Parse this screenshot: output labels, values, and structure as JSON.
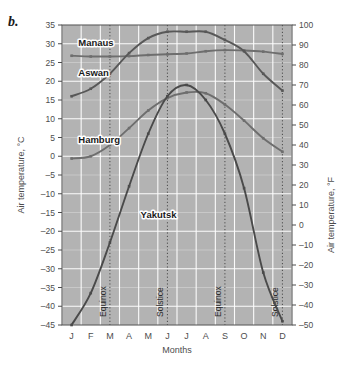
{
  "figure": {
    "panel_label": "b.",
    "background": "#ffffff",
    "plot_background": "#b3b3b3",
    "gridline_color": "#ffffff",
    "axis_color": "#4d4d4d",
    "marker_line_color": "#4d4d4d",
    "tick_label_color": "#4d4d4d"
  },
  "chart_data": {
    "type": "line",
    "title": "",
    "xlabel": "Months",
    "ylabel": "Air temperature, °C",
    "ylabel_right": "Air temperature, °F",
    "categories": [
      "J",
      "F",
      "M",
      "A",
      "M",
      "J",
      "J",
      "A",
      "S",
      "O",
      "N",
      "D"
    ],
    "month_names": [
      "January",
      "February",
      "March",
      "April",
      "May",
      "June",
      "July",
      "August",
      "September",
      "October",
      "November",
      "December"
    ],
    "ylim": [
      -45,
      35
    ],
    "yticks": [
      35,
      30,
      25,
      20,
      15,
      10,
      5,
      0,
      -5,
      -10,
      -15,
      -20,
      -25,
      -30,
      -35,
      -40,
      -45
    ],
    "ylim_right": [
      -50,
      100
    ],
    "yticks_right": [
      100,
      90,
      80,
      70,
      60,
      50,
      40,
      30,
      20,
      10,
      0,
      -10,
      -20,
      -30,
      -40,
      -50
    ],
    "grid": true,
    "legend_position": "inline-labels",
    "series": [
      {
        "name": "Manaus",
        "color": "#6e6e6e",
        "label_x_index": 0.35,
        "label_value": 29.5,
        "values": [
          26.8,
          26.6,
          26.6,
          26.7,
          27.0,
          27.2,
          27.4,
          28.0,
          28.3,
          28.2,
          27.9,
          27.3
        ]
      },
      {
        "name": "Aswan",
        "color": "#585858",
        "label_x_index": 0.35,
        "label_value": 21.5,
        "values": [
          16.0,
          18.0,
          22.0,
          27.5,
          31.5,
          33.2,
          33.2,
          33.2,
          31.0,
          28.0,
          22.0,
          17.5
        ]
      },
      {
        "name": "Hamburg",
        "color": "#6e6e6e",
        "label_x_index": 0.35,
        "label_value": 3.5,
        "values": [
          -0.6,
          0.0,
          3.0,
          7.5,
          12.2,
          15.5,
          17.0,
          16.8,
          13.8,
          9.5,
          4.8,
          1.2
        ]
      },
      {
        "name": "Yakutsk",
        "color": "#4a4a4a",
        "label_x_index": 3.6,
        "label_value": -16.5,
        "values": [
          -45.0,
          -36.5,
          -23.0,
          -8.0,
          6.0,
          16.0,
          19.0,
          15.0,
          6.0,
          -8.5,
          -31.0,
          -44.0
        ]
      }
    ],
    "vertical_markers": [
      {
        "label": "Equinox",
        "x_index": 2
      },
      {
        "label": "Solstice",
        "x_index": 5
      },
      {
        "label": "Equinox",
        "x_index": 8
      },
      {
        "label": "Solstice",
        "x_index": 11
      }
    ]
  }
}
